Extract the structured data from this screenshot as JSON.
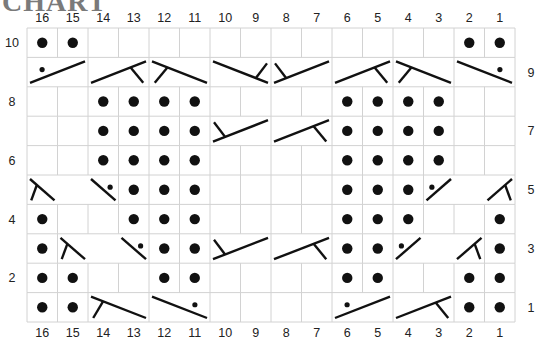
{
  "title": "CHART",
  "chart_data": {
    "type": "table",
    "columns": [
      16,
      15,
      14,
      13,
      12,
      11,
      10,
      9,
      8,
      7,
      6,
      5,
      4,
      3,
      2,
      1
    ],
    "rows": [
      10,
      9,
      8,
      7,
      6,
      5,
      4,
      3,
      2,
      1
    ],
    "left_row_labels": [
      "10",
      "8",
      "6",
      "4",
      "2"
    ],
    "right_row_labels": [
      "9",
      "7",
      "5",
      "3",
      "1"
    ],
    "legend_symbols": {
      "P": "purl (filled dot)",
      "K": "knit (empty cell)",
      "C": "cable/twist symbol spanning merged cells"
    },
    "grid": {
      "10": [
        "P",
        "P",
        "K",
        "K",
        "K",
        "K",
        "K",
        "K",
        "K",
        "K",
        "K",
        "K",
        "K",
        "K",
        "P",
        "P"
      ],
      "9": [],
      "8": [
        "K",
        "K",
        "P",
        "P",
        "P",
        "P",
        "K",
        "K",
        "K",
        "K",
        "P",
        "P",
        "P",
        "P",
        "K",
        "K"
      ],
      "7": [
        "K",
        "K",
        "P",
        "P",
        "P",
        "P",
        null,
        null,
        null,
        null,
        "P",
        "P",
        "P",
        "P",
        "K",
        "K"
      ],
      "6": [
        "K",
        "K",
        "P",
        "P",
        "P",
        "P",
        "K",
        "K",
        "K",
        "K",
        "P",
        "P",
        "P",
        "P",
        "K",
        "K"
      ],
      "5": [
        null,
        null,
        null,
        "P",
        "P",
        "P",
        "K",
        "K",
        "K",
        "K",
        "P",
        "P",
        "P",
        null,
        null,
        null
      ],
      "4": [
        "P",
        "K",
        "K",
        "P",
        "P",
        "P",
        "K",
        "K",
        "K",
        "K",
        "P",
        "P",
        "P",
        "K",
        "K",
        "P"
      ],
      "3": [
        "P",
        null,
        null,
        null,
        "P",
        "P",
        null,
        null,
        null,
        null,
        "P",
        "P",
        null,
        null,
        null,
        "P"
      ],
      "2": [
        "P",
        "P",
        "K",
        "K",
        "P",
        "P",
        "K",
        "K",
        "K",
        "K",
        "P",
        "P",
        "K",
        "K",
        "P",
        "P"
      ],
      "1": [
        "P",
        "P",
        null,
        null,
        null,
        null,
        "K",
        "K",
        "K",
        "K",
        null,
        null,
        null,
        null,
        "P",
        "P"
      ]
    },
    "cables": [
      {
        "row": 9,
        "cols": [
          16,
          15
        ],
        "kind": "rise-purl-dot"
      },
      {
        "row": 9,
        "cols": [
          14,
          13
        ],
        "kind": "rise-tick-right"
      },
      {
        "row": 9,
        "cols": [
          12,
          11
        ],
        "kind": "fall-tick-left"
      },
      {
        "row": 9,
        "cols": [
          10,
          9
        ],
        "kind": "fall-tick-top-right"
      },
      {
        "row": 9,
        "cols": [
          8,
          7
        ],
        "kind": "rise-tick-top-left"
      },
      {
        "row": 9,
        "cols": [
          6,
          5
        ],
        "kind": "rise-tick-right"
      },
      {
        "row": 9,
        "cols": [
          4,
          3
        ],
        "kind": "fall-tick-left"
      },
      {
        "row": 9,
        "cols": [
          2,
          1
        ],
        "kind": "fall-purl-dot"
      },
      {
        "row": 7,
        "cols": [
          10,
          9
        ],
        "kind": "rise-tick-top-left"
      },
      {
        "row": 7,
        "cols": [
          8,
          7
        ],
        "kind": "rise-tick-right"
      },
      {
        "row": 5,
        "cols": [
          16,
          15,
          14
        ],
        "kind": "three-st-left",
        "marks": [
          "fall-tick-left@16",
          "fall-purl-dot@14"
        ]
      },
      {
        "row": 5,
        "cols": [
          3,
          2,
          1
        ],
        "kind": "three-st-right",
        "marks": [
          "rise-purl-dot@3",
          "rise-tick-right@1"
        ]
      },
      {
        "row": 3,
        "cols": [
          15,
          14,
          13
        ],
        "kind": "three-st-left",
        "marks": [
          "fall-tick-left@15",
          "fall-purl-dot@13"
        ]
      },
      {
        "row": 3,
        "cols": [
          10,
          9
        ],
        "kind": "rise-tick-top-left"
      },
      {
        "row": 3,
        "cols": [
          8,
          7
        ],
        "kind": "rise-tick-right"
      },
      {
        "row": 3,
        "cols": [
          4,
          3,
          2
        ],
        "kind": "three-st-right",
        "marks": [
          "rise-purl-dot@4",
          "rise-tick-right@2"
        ]
      },
      {
        "row": 1,
        "cols": [
          14,
          13
        ],
        "kind": "fall-tick-bottom-left"
      },
      {
        "row": 1,
        "cols": [
          12,
          11
        ],
        "kind": "fall-purl-dot"
      },
      {
        "row": 1,
        "cols": [
          6,
          5
        ],
        "kind": "rise-purl-dot"
      },
      {
        "row": 1,
        "cols": [
          4,
          3
        ],
        "kind": "rise-tick-right"
      }
    ]
  }
}
